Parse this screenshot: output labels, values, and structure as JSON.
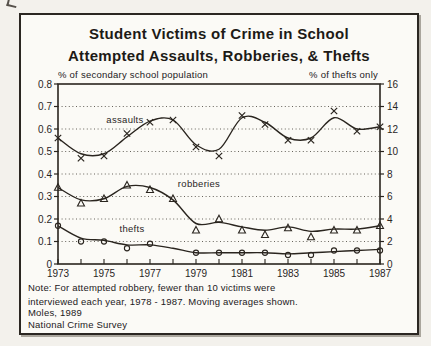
{
  "figure": {
    "title_line1": "Student Victims of Crime in School",
    "title_line2": "Attempted Assaults, Robberies, & Thefts",
    "note_line1": "Note: For attempted robbery, fewer than 10 victims were",
    "note_line2": "interviewed each year, 1978 - 1987.  Moving averages shown.",
    "source_line1": "Moles, 1989",
    "source_line2": "National Crime Survey"
  },
  "colors": {
    "ink": "#2a251f",
    "grid_dots": "#56514a",
    "paper": "#fbfaf6",
    "page_background": "#f3f1ec"
  },
  "chart_data": {
    "type": "line",
    "x": [
      1973,
      1974,
      1975,
      1976,
      1977,
      1978,
      1979,
      1980,
      1981,
      1982,
      1983,
      1984,
      1985,
      1986,
      1987
    ],
    "x_tick_labels": [
      "1973",
      "1975",
      "1977",
      "1979",
      "1981",
      "1983",
      "1985",
      "1987"
    ],
    "x_label_step": 2,
    "left_axis": {
      "label": "% of secondary school population",
      "min": 0,
      "max": 0.8,
      "ticks": [
        "0.8",
        "0.7",
        "0.6",
        "0.5",
        "0.4",
        "0.3",
        "0.2",
        "0.1",
        "0"
      ]
    },
    "right_axis": {
      "label": "% of thefts only",
      "min": 0,
      "max": 16,
      "ticks": [
        "16",
        "14",
        "12",
        "10",
        "8",
        "6",
        "4",
        "2",
        "0"
      ]
    },
    "grid": "dotted horizontal lines at each left-axis tick",
    "legend": "labels drawn on chart next to each series",
    "annotation": "Markers are annual survey values; smooth curves are moving averages",
    "series": [
      {
        "name": "assaults",
        "marker": "x",
        "values": [
          0.56,
          0.47,
          0.48,
          0.58,
          0.63,
          0.64,
          0.52,
          0.48,
          0.66,
          0.62,
          0.55,
          0.55,
          0.68,
          0.59,
          0.61
        ],
        "curve": [
          0.56,
          0.49,
          0.49,
          0.565,
          0.635,
          0.64,
          0.53,
          0.51,
          0.65,
          0.63,
          0.56,
          0.56,
          0.65,
          0.6,
          0.61
        ]
      },
      {
        "name": "robberies",
        "marker": "triangle",
        "values": [
          0.34,
          0.27,
          0.29,
          0.35,
          0.33,
          0.29,
          0.15,
          0.2,
          0.15,
          0.13,
          0.16,
          0.12,
          0.15,
          0.15,
          0.17
        ],
        "curve": [
          0.34,
          0.285,
          0.29,
          0.345,
          0.34,
          0.285,
          0.18,
          0.185,
          0.165,
          0.15,
          0.165,
          0.145,
          0.155,
          0.155,
          0.17
        ]
      },
      {
        "name": "thefts",
        "marker": "circle",
        "values": [
          0.17,
          0.1,
          0.1,
          0.07,
          0.09,
          null,
          0.05,
          0.05,
          0.05,
          0.05,
          0.04,
          0.04,
          0.06,
          0.06,
          0.06
        ],
        "curve": [
          0.17,
          0.115,
          0.105,
          0.085,
          0.085,
          0.07,
          0.05,
          0.05,
          0.05,
          0.05,
          0.045,
          0.05,
          0.055,
          0.06,
          0.065
        ]
      }
    ]
  }
}
